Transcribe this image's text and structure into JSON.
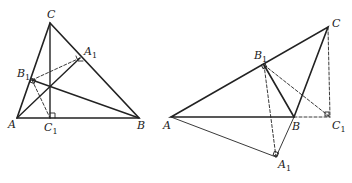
{
  "figures": [
    {
      "id": "acute-triangle",
      "points": {
        "A": {
          "x": 17,
          "y": 118,
          "label": "A",
          "lx": 8,
          "ly": 128
        },
        "B": {
          "x": 139,
          "y": 118,
          "label": "B",
          "lx": 137,
          "ly": 129
        },
        "C": {
          "x": 50,
          "y": 23,
          "label": "C",
          "lx": 47,
          "ly": 18
        },
        "A1": {
          "x": 80,
          "y": 58,
          "label": "A",
          "sub": "1",
          "lx": 84,
          "ly": 55
        },
        "B1": {
          "x": 32,
          "y": 80,
          "label": "B",
          "sub": "1",
          "lx": 17,
          "ly": 77
        },
        "C1": {
          "x": 50,
          "y": 118,
          "label": "C",
          "sub": "1",
          "lx": 44,
          "ly": 131
        },
        "H": {
          "x": 50,
          "y": 85
        }
      }
    },
    {
      "id": "obtuse-triangle",
      "points": {
        "A": {
          "x": 171,
          "y": 117,
          "label": "A",
          "lx": 163,
          "ly": 129
        },
        "B": {
          "x": 294,
          "y": 117,
          "label": "B",
          "lx": 292,
          "ly": 130
        },
        "C": {
          "x": 328,
          "y": 27,
          "label": "C",
          "lx": 332,
          "ly": 27
        },
        "A1": {
          "x": 276,
          "y": 157,
          "label": "A",
          "sub": "1",
          "lx": 278,
          "ly": 168
        },
        "B1": {
          "x": 264,
          "y": 65,
          "label": "B",
          "sub": "1",
          "lx": 254,
          "ly": 59
        },
        "C1": {
          "x": 330,
          "y": 117,
          "label": "C",
          "sub": "1",
          "lx": 332,
          "ly": 129
        }
      }
    }
  ]
}
